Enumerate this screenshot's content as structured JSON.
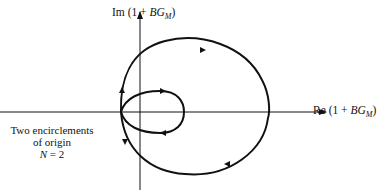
{
  "diagram": {
    "type": "nyquist-plot",
    "axes": {
      "imag_label": {
        "prefix": "Im (1 + ",
        "var": "BG",
        "sub": "M",
        "suffix": ")"
      },
      "real_label": {
        "prefix": "Re (1 + ",
        "var": "BG",
        "sub": "M",
        "suffix": ")"
      }
    },
    "annotation": {
      "line1": "Two encirclements",
      "line2": "of origin",
      "line3_var": "N",
      "line3_rest": " = 2"
    },
    "curves": [
      {
        "name": "outer-loop",
        "direction": "clockwise"
      },
      {
        "name": "inner-loop",
        "direction": "clockwise"
      }
    ],
    "encirclements": 2,
    "stroke_color": "#111111"
  }
}
